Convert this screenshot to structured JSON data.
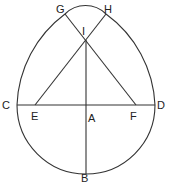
{
  "diagram": {
    "labels": {
      "C": "C",
      "D": "D",
      "A": "A",
      "B": "B",
      "E": "E",
      "F": "F",
      "G": "G",
      "H": "H",
      "I": "I"
    },
    "colors": {
      "stroke": "#333333",
      "background": "#ffffff"
    }
  }
}
